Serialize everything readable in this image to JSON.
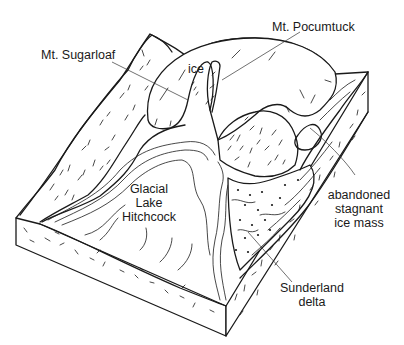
{
  "figure": {
    "type": "block-diagram",
    "colors": {
      "ink": "#1a1a1a",
      "background": "#ffffff"
    }
  },
  "labels": {
    "mt_sugarloaf": "Mt. Sugarloaf",
    "ice": "ice",
    "mt_pocumtuck": "Mt. Pocumtuck",
    "lake": [
      "Glacial",
      "Lake",
      "Hitchcock"
    ],
    "stagnant_ice": [
      "abandoned",
      "stagnant",
      "ice mass"
    ],
    "delta": [
      "Sunderland",
      "delta"
    ]
  }
}
